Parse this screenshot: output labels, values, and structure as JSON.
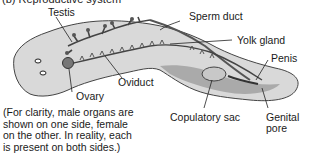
{
  "figure": {
    "title": "(b) Reproductive system",
    "labels": {
      "testis": "Testis",
      "sperm_duct": "Sperm duct",
      "yolk_gland": "Yolk gland",
      "penis": "Penis",
      "oviduct": "Oviduct",
      "ovary": "Ovary",
      "copulatory_sac": "Copulatory sac",
      "genital_pore_line1": "Genital",
      "genital_pore_line2": "pore"
    },
    "note_lines": [
      "(For clarity, male organs are",
      "shown on one side, female",
      "on the other. In reality, each",
      "is present on both sides.)"
    ]
  }
}
